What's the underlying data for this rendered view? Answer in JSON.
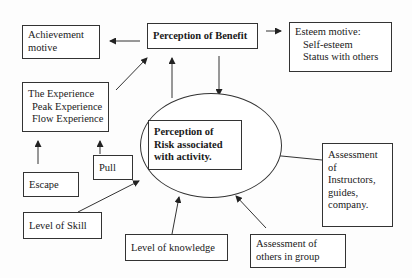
{
  "diagram": {
    "nodes": {
      "achievement": {
        "lines": [
          "Achievement",
          "motive"
        ]
      },
      "benefit": {
        "label": "Perception of Benefit"
      },
      "esteem": {
        "title": "Esteem motive:",
        "items": [
          "Self-esteem",
          "Status with others"
        ]
      },
      "experience": {
        "title": "The Experience",
        "items": [
          "Peak Experience",
          "Flow Experience"
        ]
      },
      "risk": {
        "lines": [
          "Perception of",
          "Risk associated",
          "with activity."
        ]
      },
      "escape": {
        "label": "Escape"
      },
      "pull": {
        "label": "Pull"
      },
      "skill": {
        "label": "Level of Skill"
      },
      "knowledge": {
        "label": "Level of knowledge"
      },
      "others": {
        "lines": [
          "Assessment of",
          "others in group"
        ]
      },
      "instructors": {
        "lines": [
          "Assessment",
          "of",
          "Instructors,",
          "guides,",
          "company."
        ]
      }
    },
    "edges": [
      {
        "from": "benefit",
        "to": "achievement"
      },
      {
        "from": "benefit",
        "to": "esteem"
      },
      {
        "from": "experience",
        "to": "benefit"
      },
      {
        "from": "risk",
        "to": "benefit"
      },
      {
        "from": "benefit",
        "to": "risk"
      },
      {
        "from": "escape",
        "to": "experience"
      },
      {
        "from": "pull",
        "to": "experience"
      },
      {
        "from": "skill",
        "to": "risk"
      },
      {
        "from": "knowledge",
        "to": "risk"
      },
      {
        "from": "others",
        "to": "risk"
      },
      {
        "from": "instructors",
        "to": "risk"
      }
    ],
    "colors": {
      "line": "#333333",
      "background": "#fdfdfd"
    }
  }
}
